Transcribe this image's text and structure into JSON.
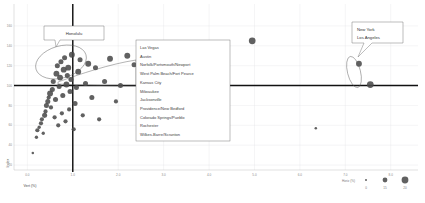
{
  "chart_data": {
    "type": "scatter",
    "title": "",
    "xlabel": "Vert (%)",
    "ylabel": "Index",
    "xlim": [
      -0.25,
      8.6
    ],
    "ylim": [
      15,
      168
    ],
    "xticks": [
      "0.0",
      "1.0",
      "2.0",
      "3.0",
      "4.0",
      "5.0",
      "6.0",
      "7.0",
      "8.0"
    ],
    "xtick_values": [
      0,
      1,
      2,
      3,
      4,
      5,
      6,
      7,
      8
    ],
    "yticks": [
      "160",
      "140",
      "120",
      "100",
      "80",
      "60",
      "40",
      "20"
    ],
    "ytick_values": [
      160,
      140,
      120,
      100,
      80,
      60,
      40,
      20
    ],
    "grid": true,
    "legend_position": "bottom-right",
    "reference_lines": {
      "vertical_x": 1.0,
      "horizontal_y": 100
    },
    "size_field": "Horiz (%)",
    "points": [
      {
        "x": 0.12,
        "y": 32,
        "s": 3
      },
      {
        "x": 0.2,
        "y": 48,
        "s": 4
      },
      {
        "x": 0.22,
        "y": 55,
        "s": 5
      },
      {
        "x": 0.26,
        "y": 58,
        "s": 4
      },
      {
        "x": 0.3,
        "y": 62,
        "s": 5
      },
      {
        "x": 0.32,
        "y": 66,
        "s": 5
      },
      {
        "x": 0.35,
        "y": 52,
        "s": 4
      },
      {
        "x": 0.38,
        "y": 70,
        "s": 6
      },
      {
        "x": 0.4,
        "y": 74,
        "s": 5
      },
      {
        "x": 0.42,
        "y": 80,
        "s": 6
      },
      {
        "x": 0.45,
        "y": 84,
        "s": 6
      },
      {
        "x": 0.47,
        "y": 88,
        "s": 5
      },
      {
        "x": 0.5,
        "y": 92,
        "s": 7
      },
      {
        "x": 0.52,
        "y": 78,
        "s": 5
      },
      {
        "x": 0.55,
        "y": 96,
        "s": 6
      },
      {
        "x": 0.57,
        "y": 104,
        "s": 6
      },
      {
        "x": 0.6,
        "y": 68,
        "s": 5
      },
      {
        "x": 0.62,
        "y": 86,
        "s": 6
      },
      {
        "x": 0.64,
        "y": 112,
        "s": 7
      },
      {
        "x": 0.66,
        "y": 120,
        "s": 6
      },
      {
        "x": 0.68,
        "y": 60,
        "s": 5
      },
      {
        "x": 0.7,
        "y": 99,
        "s": 6
      },
      {
        "x": 0.72,
        "y": 108,
        "s": 7
      },
      {
        "x": 0.74,
        "y": 124,
        "s": 6
      },
      {
        "x": 0.76,
        "y": 72,
        "s": 5
      },
      {
        "x": 0.78,
        "y": 90,
        "s": 6
      },
      {
        "x": 0.8,
        "y": 116,
        "s": 7
      },
      {
        "x": 0.82,
        "y": 128,
        "s": 6
      },
      {
        "x": 0.84,
        "y": 64,
        "s": 5
      },
      {
        "x": 0.86,
        "y": 101,
        "s": 7
      },
      {
        "x": 0.88,
        "y": 110,
        "s": 6
      },
      {
        "x": 0.9,
        "y": 118,
        "s": 7
      },
      {
        "x": 0.92,
        "y": 76,
        "s": 5
      },
      {
        "x": 0.94,
        "y": 94,
        "s": 6
      },
      {
        "x": 0.96,
        "y": 106,
        "s": 6
      },
      {
        "x": 0.98,
        "y": 131,
        "s": 7
      },
      {
        "x": 1.02,
        "y": 56,
        "s": 5
      },
      {
        "x": 1.05,
        "y": 82,
        "s": 6
      },
      {
        "x": 1.08,
        "y": 98,
        "s": 6
      },
      {
        "x": 1.12,
        "y": 114,
        "s": 7
      },
      {
        "x": 1.16,
        "y": 126,
        "s": 6
      },
      {
        "x": 1.22,
        "y": 70,
        "s": 5
      },
      {
        "x": 1.28,
        "y": 102,
        "s": 6
      },
      {
        "x": 1.34,
        "y": 122,
        "s": 7
      },
      {
        "x": 1.42,
        "y": 88,
        "s": 6
      },
      {
        "x": 1.5,
        "y": 118,
        "s": 6
      },
      {
        "x": 1.58,
        "y": 66,
        "s": 5
      },
      {
        "x": 1.7,
        "y": 104,
        "s": 6
      },
      {
        "x": 1.82,
        "y": 127,
        "s": 7
      },
      {
        "x": 1.95,
        "y": 84,
        "s": 5
      },
      {
        "x": 2.05,
        "y": 100,
        "s": 6
      },
      {
        "x": 2.2,
        "y": 130,
        "s": 7
      },
      {
        "x": 2.35,
        "y": 121,
        "s": 6
      },
      {
        "x": 2.5,
        "y": 124,
        "s": 7
      },
      {
        "x": 2.62,
        "y": 99,
        "s": 6
      },
      {
        "x": 2.8,
        "y": 128,
        "s": 7
      },
      {
        "x": 3.0,
        "y": 142,
        "s": 7
      },
      {
        "x": 3.05,
        "y": 103,
        "s": 6
      },
      {
        "x": 3.4,
        "y": 126,
        "s": 6
      },
      {
        "x": 3.75,
        "y": 101,
        "s": 6
      },
      {
        "x": 4.1,
        "y": 140,
        "s": 7
      },
      {
        "x": 4.95,
        "y": 145,
        "s": 8
      },
      {
        "x": 6.35,
        "y": 57,
        "s": 3
      },
      {
        "x": 7.3,
        "y": 122,
        "s": 7
      },
      {
        "x": 7.55,
        "y": 101,
        "s": 8
      }
    ],
    "annotations": [
      {
        "label": "Honolulu",
        "type": "callout-box",
        "target": "left-cluster-lasso"
      },
      {
        "label": "New York\nLos Angeles",
        "type": "callout-box",
        "target": "right-lasso"
      }
    ]
  },
  "callouts": {
    "honolulu": {
      "label": "Honolulu"
    },
    "metro": {
      "line1": "New York",
      "line2": "Los Angeles"
    }
  },
  "city_list": {
    "items": [
      "Las Vegas",
      "Austin",
      "Norfolk/Portsmouth/Newport",
      "West Palm Beach/Fort Pearce",
      "Kansas City",
      "Milwaukee",
      "Jacksonville",
      "Providence/New Bedford",
      "Colorado Springs/Pueblo",
      "Rochester",
      "Wilkes-Barre/Scranton"
    ]
  },
  "legend": {
    "title": "Horiz (%)",
    "sizes": [
      {
        "label": "0",
        "r": 1.0
      },
      {
        "label": "15",
        "r": 2.4
      },
      {
        "label": "20",
        "r": 3.4
      }
    ]
  },
  "colors": {
    "point": "#4b4b4b",
    "grid": "#e2e2e6",
    "reference": "#111111",
    "outline": "#6e6e6e",
    "text": "#3d3d3d",
    "tick": "#8a8a8a"
  }
}
